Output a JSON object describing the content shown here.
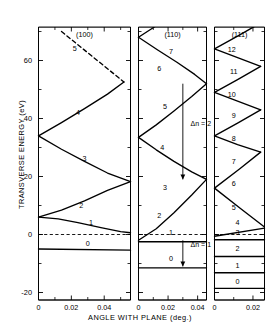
{
  "figure": {
    "axis": {
      "ylabel": "TRANSVERSE  ENERGY  (eV)",
      "xlabel": "ANGLE  WITH  PLANE  (deg.)",
      "yticks": [
        "60",
        "40",
        "20",
        "0",
        "-20"
      ],
      "ytick_values": [
        60,
        40,
        20,
        0,
        -20
      ],
      "ylim": [
        -26,
        70
      ],
      "line_color": "#000000"
    },
    "panels": [
      {
        "title": "(100)",
        "xticks": [
          "0",
          "0.02",
          "0.04"
        ],
        "xtick_values": [
          0,
          0.02,
          0.04
        ],
        "xlim": [
          0,
          0.056
        ],
        "curve_labels": [
          "0",
          "1",
          "2",
          "3",
          "4",
          "5"
        ],
        "annotations": []
      },
      {
        "title": "(110)",
        "xticks": [
          "0",
          "0.02",
          "0.04"
        ],
        "xtick_values": [
          0,
          0.02,
          0.04
        ],
        "xlim": [
          0,
          0.046
        ],
        "curve_labels": [
          "0",
          "1",
          "2",
          "3",
          "4",
          "5",
          "6",
          "7"
        ],
        "annotations": [
          "Δn = 1",
          "Δn = 2"
        ]
      },
      {
        "title": "(111)",
        "xticks": [
          "0",
          "0.02"
        ],
        "xtick_values": [
          0,
          0.02
        ],
        "xlim": [
          0,
          0.026
        ],
        "curve_labels": [
          "0",
          "1",
          "2",
          "3",
          "4",
          "5",
          "6",
          "7",
          "8",
          "9",
          "10",
          "11",
          "12"
        ],
        "annotations": []
      }
    ]
  },
  "chart_data": {
    "type": "line",
    "title": "",
    "xlabel": "ANGLE  WITH  PLANE  (deg.)",
    "ylabel": "TRANSVERSE  ENERGY  (eV)",
    "ylim": [
      -26,
      70
    ],
    "grid": false,
    "legend": "none",
    "panels": [
      {
        "name": "(100)",
        "xlim": [
          0,
          0.056
        ],
        "xticks": [
          0,
          0.02,
          0.04
        ],
        "yticks": [
          -20,
          0,
          20,
          40,
          60
        ],
        "zero_line": {
          "y": 0,
          "style": "dashed"
        },
        "series": [
          {
            "name": "0",
            "label_xy": [
              0.03,
              -3.2
            ],
            "x": [
              0.0,
              0.056
            ],
            "y": [
              -5.0,
              -5.4
            ]
          },
          {
            "name": "1",
            "label_xy": [
              0.032,
              4.0
            ],
            "x": [
              0.0,
              0.012,
              0.024,
              0.038,
              0.05,
              0.056
            ],
            "y": [
              6.0,
              5.4,
              4.1,
              2.4,
              1.0,
              0.6
            ]
          },
          {
            "name": "2",
            "label_xy": [
              0.026,
              10.0
            ],
            "x": [
              0.0,
              0.014,
              0.028,
              0.042,
              0.056
            ],
            "y": [
              6.0,
              8.4,
              11.6,
              15.2,
              18.2
            ]
          },
          {
            "name": "3",
            "label_xy": [
              0.028,
              26.0
            ],
            "x": [
              0.0,
              0.014,
              0.028,
              0.042,
              0.056
            ],
            "y": [
              34.0,
              29.4,
              25.2,
              21.2,
              18.2
            ]
          },
          {
            "name": "4",
            "label_xy": [
              0.024,
              42.0
            ],
            "x": [
              0.0,
              0.014,
              0.028,
              0.042,
              0.052
            ],
            "y": [
              34.0,
              38.6,
              43.4,
              48.4,
              52.6
            ]
          },
          {
            "name": "5",
            "label_xy": [
              0.022,
              64.0
            ],
            "x": [
              0.014,
              0.052
            ],
            "y": [
              70.0,
              52.6
            ],
            "dash_from": 0.014,
            "dash_to": 0.021
          }
        ]
      },
      {
        "name": "(110)",
        "xlim": [
          0,
          0.046
        ],
        "xticks": [
          0,
          0.02,
          0.04
        ],
        "yticks": [
          -20,
          0,
          20,
          40,
          60
        ],
        "zero_line": {
          "y": 0,
          "style": "dashed"
        },
        "arrows": [
          {
            "label": "Δn = 1",
            "x": 0.03,
            "y_from": -2.0,
            "y_to": -11.0
          },
          {
            "label": "Δn = 2",
            "x": 0.03,
            "y_from": 52.0,
            "y_to": 19.0
          }
        ],
        "series": [
          {
            "name": "0",
            "label_xy": [
              0.022,
              -8.5
            ],
            "x": [
              0.0,
              0.046
            ],
            "y": [
              -11.5,
              -11.5
            ]
          },
          {
            "name": "1",
            "label_xy": [
              0.022,
              0.6
            ],
            "x": [
              0.0,
              0.046
            ],
            "y": [
              -2.5,
              -2.5
            ]
          },
          {
            "name": "2",
            "label_xy": [
              0.014,
              6.4
            ],
            "x": [
              0.0,
              0.012,
              0.024,
              0.036,
              0.046
            ],
            "y": [
              -2.0,
              2.0,
              7.5,
              13.6,
              19.0
            ]
          },
          {
            "name": "3",
            "label_xy": [
              0.018,
              16.0
            ],
            "x": [
              0.0,
              0.012,
              0.024,
              0.036,
              0.046
            ],
            "y": [
              33.5,
              29.2,
              25.2,
              21.6,
              19.0
            ]
          },
          {
            "name": "4",
            "label_xy": [
              0.016,
              30.0
            ],
            "x": [
              0.0,
              0.012,
              0.024,
              0.036,
              0.046
            ],
            "y": [
              33.5,
              37.8,
              42.6,
              47.6,
              52.0
            ]
          },
          {
            "name": "5",
            "label_xy": [
              0.018,
              44.0
            ],
            "x": [
              0.0,
              0.013,
              0.026,
              0.038,
              0.046
            ],
            "y": [
              68.0,
              63.6,
              59.4,
              55.2,
              52.0
            ]
          },
          {
            "name": "6",
            "label_xy": [
              0.014,
              57.0
            ],
            "x": [
              0.0,
              0.012,
              0.024,
              0.036,
              0.044
            ],
            "y": [
              68.0,
              72.0,
              77.0,
              82.0,
              86.0
            ]
          },
          {
            "name": "7",
            "label_xy": [
              0.022,
              63.0
            ],
            "x": [
              0.008,
              0.044
            ],
            "y": [
              92.0,
              86.0
            ],
            "dash_from": 0.008,
            "dash_to": 0.016
          }
        ]
      },
      {
        "name": "(111)",
        "xlim": [
          0,
          0.026
        ],
        "xticks": [
          0,
          0.02
        ],
        "yticks": [
          -20,
          0,
          20,
          40,
          60
        ],
        "zero_line": {
          "y": 0,
          "style": "dashed"
        },
        "series": [
          {
            "name": "0",
            "label_xy": [
              0.012,
              -16.5
            ],
            "x": [
              0.0,
              0.026
            ],
            "y": [
              -18.6,
              -18.6
            ]
          },
          {
            "name": "1",
            "label_xy": [
              0.012,
              -11.0
            ],
            "x": [
              0.0,
              0.026
            ],
            "y": [
              -13.2,
              -13.2
            ]
          },
          {
            "name": "2",
            "label_xy": [
              0.012,
              -5.0
            ],
            "x": [
              0.0,
              0.026
            ],
            "y": [
              -7.6,
              -7.6
            ]
          },
          {
            "name": "3",
            "label_xy": [
              0.012,
              0.5
            ],
            "x": [
              0.0,
              0.026
            ],
            "y": [
              -1.8,
              -1.8
            ]
          },
          {
            "name": "4",
            "label_xy": [
              0.012,
              4.0
            ],
            "x": [
              0.0,
              0.026
            ],
            "y": [
              -0.6,
              2.2
            ]
          },
          {
            "name": "5",
            "label_xy": [
              0.01,
              9.0
            ],
            "x": [
              0.0,
              0.013,
              0.026
            ],
            "y": [
              16.0,
              9.2,
              2.6
            ]
          },
          {
            "name": "6",
            "label_xy": [
              0.01,
              17.5
            ],
            "x": [
              0.0,
              0.013,
              0.024
            ],
            "y": [
              16.0,
              22.6,
              28.4
            ]
          },
          {
            "name": "7",
            "label_xy": [
              0.01,
              25.0
            ],
            "x": [
              0.0,
              0.012,
              0.024
            ],
            "y": [
              34.0,
              31.0,
              28.4
            ]
          },
          {
            "name": "8",
            "label_xy": [
              0.01,
              33.0
            ],
            "x": [
              0.0,
              0.012,
              0.024
            ],
            "y": [
              34.0,
              38.4,
              43.0
            ]
          },
          {
            "name": "9",
            "label_xy": [
              0.01,
              41.0
            ],
            "x": [
              0.0,
              0.012,
              0.024
            ],
            "y": [
              49.0,
              46.0,
              43.0
            ]
          },
          {
            "name": "10",
            "label_xy": [
              0.009,
              48.0
            ],
            "x": [
              0.0,
              0.012,
              0.024
            ],
            "y": [
              49.0,
              53.4,
              58.0
            ]
          },
          {
            "name": "11",
            "label_xy": [
              0.01,
              56.0
            ],
            "x": [
              0.0,
              0.012,
              0.024
            ],
            "y": [
              64.0,
              61.0,
              58.0
            ]
          },
          {
            "name": "12",
            "label_xy": [
              0.009,
              63.5
            ],
            "x": [
              0.0,
              0.012,
              0.022
            ],
            "y": [
              64.0,
              68.4,
              72.2
            ]
          },
          {
            "name": "13",
            "label_xy": null,
            "x": [
              0.012,
              0.022
            ],
            "y": [
              78.0,
              72.2
            ],
            "dash_from": 0.012,
            "dash_to": 0.017
          }
        ]
      }
    ]
  }
}
